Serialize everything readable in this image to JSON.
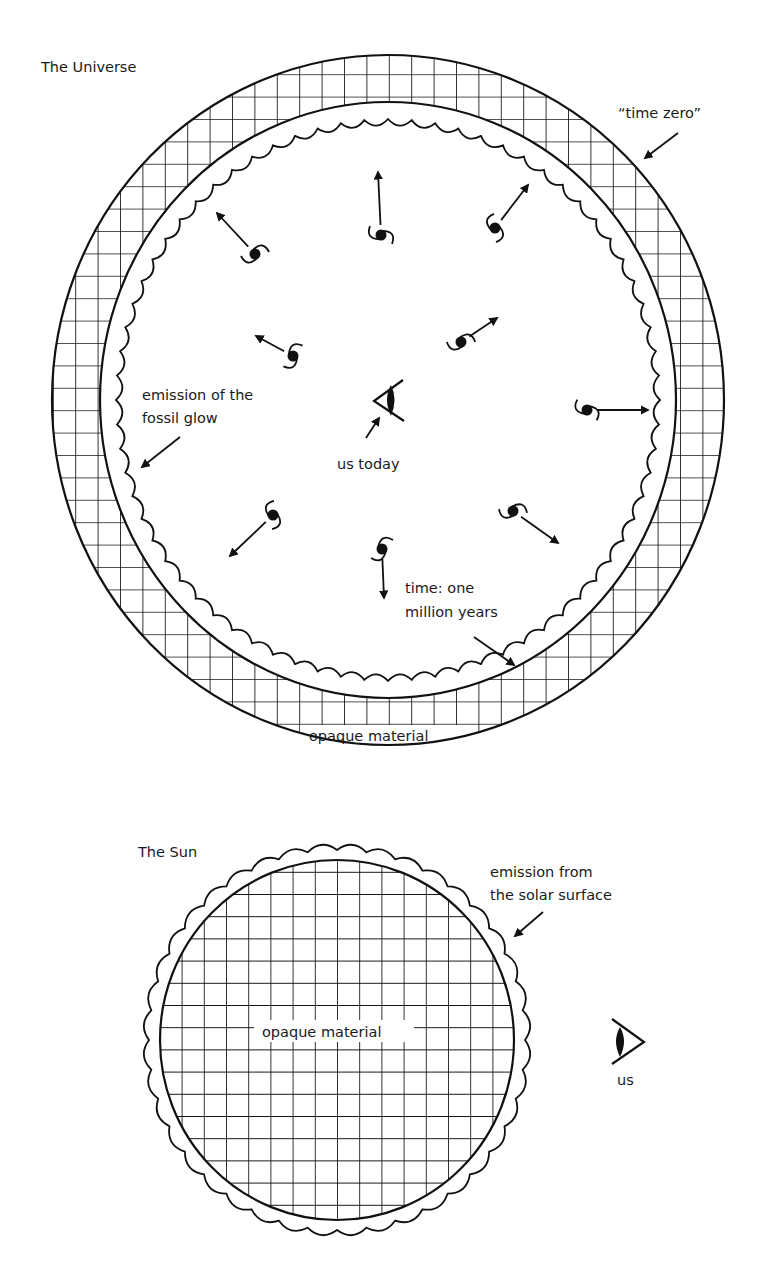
{
  "colors": {
    "ink": "#111111",
    "background": "#ffffff"
  },
  "universe": {
    "title": "The Universe",
    "labels": {
      "time_zero": "“time zero”",
      "fossil_glow_line1": "emission of the",
      "fossil_glow_line2": "fossil glow",
      "us_today": "us today",
      "time_line1": "time: one",
      "time_line2": "million years",
      "opaque": "opaque material"
    },
    "galaxies": [
      {
        "x": 255,
        "y": 254,
        "arrow_to": [
          217,
          213
        ]
      },
      {
        "x": 381,
        "y": 235,
        "arrow_to": [
          378,
          172
        ]
      },
      {
        "x": 495,
        "y": 228,
        "arrow_to": [
          528,
          185
        ]
      },
      {
        "x": 293,
        "y": 356,
        "arrow_to": [
          256,
          336
        ]
      },
      {
        "x": 461,
        "y": 342,
        "arrow_to": [
          497,
          318
        ]
      },
      {
        "x": 587,
        "y": 410,
        "arrow_to": [
          648,
          410
        ]
      },
      {
        "x": 273,
        "y": 515,
        "arrow_to": [
          230,
          556
        ]
      },
      {
        "x": 382,
        "y": 549,
        "arrow_to": [
          384,
          598
        ]
      },
      {
        "x": 513,
        "y": 511,
        "arrow_to": [
          558,
          543
        ]
      }
    ]
  },
  "sun": {
    "title": "The Sun",
    "labels": {
      "emission_line1": "emission from",
      "emission_line2": "the solar surface",
      "opaque": "opaque material",
      "us": "us"
    }
  }
}
